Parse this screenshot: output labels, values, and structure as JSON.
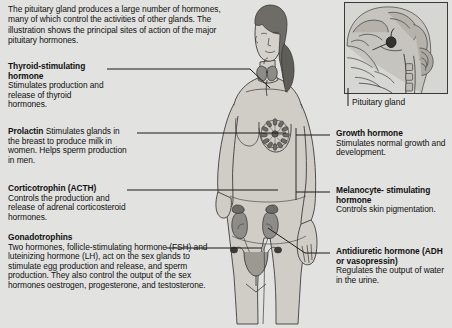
{
  "page": {
    "background_color": "#e2e2e0",
    "text_color": "#111111",
    "line_color": "#1a1a1a",
    "skin_color": "#cfcdc6",
    "organ_color": "#8e8c86"
  },
  "intro": {
    "text": "The pituitary gland produces a large number of hormones, many of which control the activities of other glands. The illustration shows the principal sites of action of the major pituitary hormones."
  },
  "inset": {
    "name": "head-sagittal-section",
    "caption": "Pituitary gland"
  },
  "captions": {
    "left": [
      {
        "id": "thyroid-stimulating-hormone",
        "heading": "Thyroid-stimulating hormone",
        "body": "Stimulates production and release of thyroid hormones.",
        "inline": false
      },
      {
        "id": "prolactin",
        "heading": "Prolactin",
        "body": "Stimulates glands in the breast to produce milk in women. Helps sperm production in men.",
        "inline": true
      },
      {
        "id": "corticotrophin-acth",
        "heading": "Corticotrophin (ACTH)",
        "body": "Controls the production and release of adrenal corticosteroid hormones.",
        "inline": false
      },
      {
        "id": "gonadotrophins",
        "heading": "Gonadotrophins",
        "body": "Two hormones, follicle-stimulating hormone (FSH) and luteinizing hormone (LH), act on the sex glands to stimulate egg production and release, and sperm production. They also control the output of the sex hormones oestrogen, progesterone, and testosterone.",
        "inline": false
      }
    ],
    "right": [
      {
        "id": "growth-hormone",
        "heading": "Growth hormone",
        "body": "Stimulates normal growth and development.",
        "inline": false
      },
      {
        "id": "melanocyte-stimulating-hormone",
        "heading": "Melanocyte- stimulating hormone",
        "body": "Controls skin pigmentation.",
        "inline": false
      },
      {
        "id": "antidiuretic-hormone",
        "heading": "Antidiuretic hormone (ADH or vasopressin)",
        "body": "Regulates the output of water in the urine.",
        "inline": false
      }
    ]
  },
  "illustration": {
    "name": "female-figure-endocrine-targets",
    "organs": [
      "thyroid-gland",
      "breast-mammary-glands",
      "adrenal-glands",
      "kidneys",
      "uterus",
      "ovaries"
    ]
  }
}
